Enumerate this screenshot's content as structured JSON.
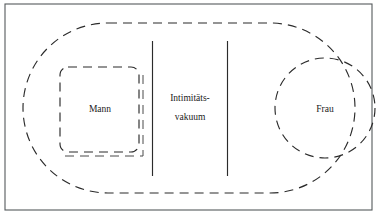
{
  "figure": {
    "type": "concept-diagram",
    "background_color": "#ffffff",
    "line_color": "#2b2b2b",
    "frame_color": "#555a5c",
    "frame": {
      "name": "outer-frame",
      "x": 5,
      "y": 4,
      "width": 367,
      "height": 206,
      "style": "solid"
    },
    "outer_region": {
      "name": "couple-field",
      "shape": "stadium",
      "x": 23,
      "y": 23,
      "width": 332,
      "height": 170,
      "radius": 85,
      "style": "dashed",
      "label": ""
    },
    "regions": [
      {
        "name": "mann-region",
        "shape": "rounded-square",
        "label": "Mann",
        "x": 60,
        "y": 67,
        "width": 79,
        "height": 85,
        "radius": 8,
        "style": "dashed",
        "has_shadow": true,
        "label_x": 100,
        "label_y": 109
      },
      {
        "name": "frau-region",
        "shape": "circle",
        "label": "Frau",
        "cx": 325,
        "cy": 108,
        "r": 50,
        "style": "dashed",
        "has_shadow": false,
        "label_x": 325,
        "label_y": 109
      }
    ],
    "divider_lines": [
      {
        "name": "divider-left",
        "x": 152.5,
        "y1": 41,
        "y2": 176,
        "style": "solid"
      },
      {
        "name": "divider-right",
        "x": 227.5,
        "y1": 41,
        "y2": 176,
        "style": "solid"
      }
    ],
    "center_label": {
      "name": "intimitaetsvakuum-label",
      "lines": [
        "Intimitäts-",
        "vakuum"
      ],
      "x": 190,
      "line1_y": 99,
      "line2_y": 118
    }
  }
}
